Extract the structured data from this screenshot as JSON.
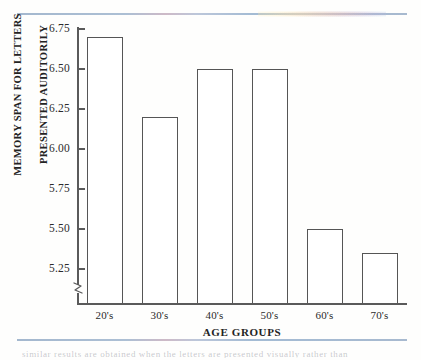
{
  "figure": {
    "caption_remnant": "similar results are obtained when the letters are presented visually rather than"
  },
  "chart_data": {
    "type": "bar",
    "title": "",
    "subtitle": "",
    "categories": [
      "20's",
      "30's",
      "40's",
      "50's",
      "60's",
      "70's"
    ],
    "values": [
      6.7,
      6.2,
      6.5,
      6.5,
      5.5,
      5.35
    ],
    "series": [
      {
        "name": "Memory span",
        "values": [
          6.7,
          6.2,
          6.5,
          6.5,
          5.5,
          5.35
        ]
      }
    ],
    "xlabel": "AGE GROUPS",
    "ylabel_line1": "MEMORY SPAN FOR LETTERS",
    "ylabel_line2": "PRESENTED AUDITORILY",
    "ylim": [
      5.25,
      6.75
    ],
    "ytick_labels": [
      "6.75",
      "6.50",
      "6.25",
      "6.00",
      "5.75",
      "5.50",
      "5.25"
    ],
    "ytick_values": [
      6.75,
      6.5,
      6.25,
      6.0,
      5.75,
      5.5,
      5.25
    ],
    "y_axis_break": true,
    "grid": false,
    "legend": "none",
    "bar_fill_color": "#ffffff",
    "bar_edge_color": "#555555",
    "axis_color": "#5a5a5a",
    "text_color": "#232323",
    "rule_color": "#9fb4cc"
  }
}
